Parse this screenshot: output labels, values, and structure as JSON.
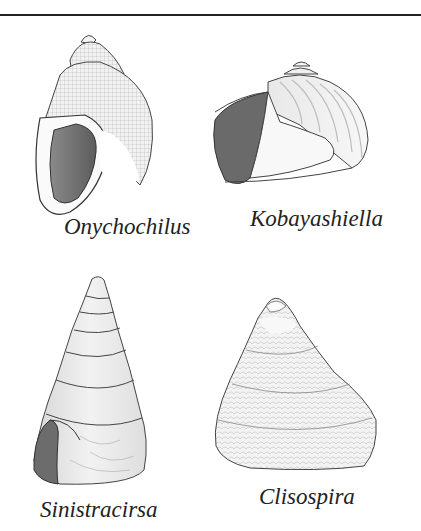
{
  "figure": {
    "shells": [
      {
        "id": "onychochilus",
        "label": "Onychochilus",
        "position": "top-left"
      },
      {
        "id": "kobayashiella",
        "label": "Kobayashiella",
        "position": "top-right"
      },
      {
        "id": "sinistracirsa",
        "label": "Sinistracirsa",
        "position": "bottom-left"
      },
      {
        "id": "clisospira",
        "label": "Clisospira",
        "position": "bottom-right"
      }
    ]
  },
  "colors": {
    "ink": "#222222",
    "shell_light": "#efefef",
    "shell_mid": "#cfcfcf",
    "aperture_dark": "#6e6e6e"
  }
}
